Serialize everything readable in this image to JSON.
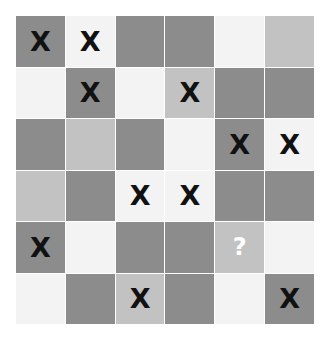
{
  "puzzle": {
    "rows": 6,
    "cols": 6,
    "colors": {
      "dark": "#8c8c8c",
      "medium": "#c2c2c2",
      "light": "#f3f3f3"
    },
    "cells": [
      [
        {
          "shade": "dark",
          "mark": "X"
        },
        {
          "shade": "light",
          "mark": "X"
        },
        {
          "shade": "dark",
          "mark": ""
        },
        {
          "shade": "dark",
          "mark": ""
        },
        {
          "shade": "light",
          "mark": ""
        },
        {
          "shade": "medium",
          "mark": ""
        }
      ],
      [
        {
          "shade": "light",
          "mark": ""
        },
        {
          "shade": "dark",
          "mark": "X"
        },
        {
          "shade": "light",
          "mark": ""
        },
        {
          "shade": "medium",
          "mark": "X"
        },
        {
          "shade": "dark",
          "mark": ""
        },
        {
          "shade": "dark",
          "mark": ""
        }
      ],
      [
        {
          "shade": "dark",
          "mark": ""
        },
        {
          "shade": "medium",
          "mark": ""
        },
        {
          "shade": "dark",
          "mark": ""
        },
        {
          "shade": "light",
          "mark": ""
        },
        {
          "shade": "dark",
          "mark": "X"
        },
        {
          "shade": "light",
          "mark": "X"
        }
      ],
      [
        {
          "shade": "medium",
          "mark": ""
        },
        {
          "shade": "dark",
          "mark": ""
        },
        {
          "shade": "light",
          "mark": "X"
        },
        {
          "shade": "light",
          "mark": "X"
        },
        {
          "shade": "dark",
          "mark": ""
        },
        {
          "shade": "dark",
          "mark": ""
        }
      ],
      [
        {
          "shade": "dark",
          "mark": "X"
        },
        {
          "shade": "light",
          "mark": ""
        },
        {
          "shade": "dark",
          "mark": ""
        },
        {
          "shade": "dark",
          "mark": ""
        },
        {
          "shade": "medium",
          "mark": "?"
        },
        {
          "shade": "light",
          "mark": ""
        }
      ],
      [
        {
          "shade": "light",
          "mark": ""
        },
        {
          "shade": "dark",
          "mark": ""
        },
        {
          "shade": "medium",
          "mark": "X"
        },
        {
          "shade": "dark",
          "mark": ""
        },
        {
          "shade": "light",
          "mark": ""
        },
        {
          "shade": "dark",
          "mark": "X"
        }
      ]
    ]
  }
}
